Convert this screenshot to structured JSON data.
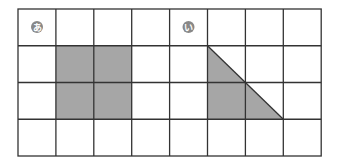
{
  "figure": {
    "grid": {
      "cols": 8,
      "rows": 4,
      "left": 18,
      "top": 9,
      "cell_w": 37.9,
      "cell_h": 36.75
    },
    "colors": {
      "line": "#333333",
      "fill": "#a6a6a6",
      "badge": "#888888",
      "background": "#ffffff"
    },
    "shapes": [
      {
        "label": "あ",
        "type": "square",
        "cells": [
          [
            1,
            1
          ],
          [
            2,
            1
          ],
          [
            1,
            2
          ],
          [
            2,
            2
          ]
        ],
        "badge_cell": [
          0,
          0
        ]
      },
      {
        "label": "い",
        "type": "triangle",
        "vertices": [
          [
            5,
            1
          ],
          [
            5,
            3
          ],
          [
            7,
            3
          ]
        ],
        "badge_cell": [
          4,
          0
        ]
      }
    ]
  }
}
